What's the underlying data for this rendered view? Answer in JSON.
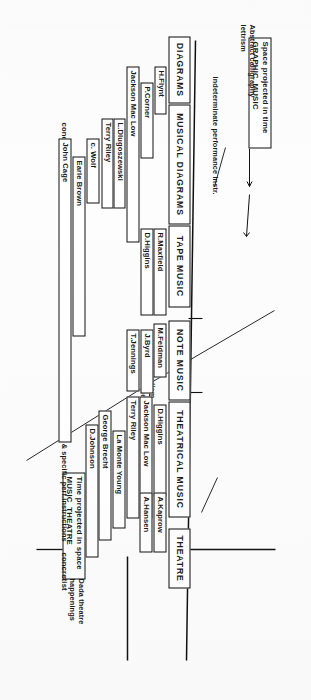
{
  "diagram": {
    "axis_labels": [
      {
        "id": "axis-top-concretist",
        "text": "concretist"
      },
      {
        "id": "axis-mid-abstract",
        "text": "abstract"
      },
      {
        "id": "axis-bottom-concretist",
        "text": "concretist"
      }
    ],
    "categories": [
      {
        "id": "diagrams",
        "label": "DIAGRAMS"
      },
      {
        "id": "musical-diagrams",
        "label": "MUSICAL DIAGRAMS"
      },
      {
        "id": "tape-music",
        "label": "TAPE MUSIC"
      },
      {
        "id": "note-music",
        "label": "NOTE MUSIC"
      },
      {
        "id": "theatrical-music",
        "label": "THEATRICAL MUSIC"
      },
      {
        "id": "theatre",
        "label": "THEATRE"
      }
    ],
    "influence_boxes": [
      {
        "id": "graphic-music",
        "line1": "Space projected in time",
        "line2": "GRAPHIC  MUSIC"
      },
      {
        "id": "music-theatre",
        "line1": "Time projected in space",
        "line2": "MUSIC  THEATRE"
      }
    ],
    "annotations": [
      {
        "id": "abstract-calligraphy",
        "text": "Abstract calligraphy\nlettrism"
      },
      {
        "id": "indeterminate-performance",
        "text": "indeterminate performance instr."
      },
      {
        "id": "futurist-brutism",
        "text": "Futurist Brutism\nvia Varese"
      },
      {
        "id": "determinate-specific",
        "text": "determinate & specific perf.instructions"
      },
      {
        "id": "dada-theatre",
        "text": "Dada theatre\nhappenings"
      }
    ],
    "people": [
      {
        "id": "h-flynt",
        "name": "H.Flynt"
      },
      {
        "id": "p-corner",
        "name": "P.Corner"
      },
      {
        "id": "jackson-mac-low-1",
        "name": "Jackson Mac Low"
      },
      {
        "id": "l-dlugoszewski",
        "name": "L.Dlugoszewski"
      },
      {
        "id": "terry-riley-1",
        "name": "Terry Riley"
      },
      {
        "id": "c-wolf",
        "name": "c. Wolf"
      },
      {
        "id": "earle-brown",
        "name": "Earle Brown"
      },
      {
        "id": "john-cage",
        "name": "John Cage"
      },
      {
        "id": "r-maxfield",
        "name": "R.Maxfield"
      },
      {
        "id": "d-higgins-1",
        "name": "D.Higgins"
      },
      {
        "id": "m-feldman",
        "name": "M.Feldman"
      },
      {
        "id": "j-byrd",
        "name": "J.Byrd"
      },
      {
        "id": "t-jennings",
        "name": "T.Jennings"
      },
      {
        "id": "d-higgins-2",
        "name": "D.Higgins"
      },
      {
        "id": "jackson-mac-low-2",
        "name": "Jackson Mac Low"
      },
      {
        "id": "terry-riley-2",
        "name": "Terry Riley"
      },
      {
        "id": "la-monte-young",
        "name": "La Monte Young"
      },
      {
        "id": "george-brecht",
        "name": "George Brecht"
      },
      {
        "id": "d-johnson",
        "name": "D.Johnson"
      },
      {
        "id": "a-kaprow",
        "name": "A.Kaprow"
      },
      {
        "id": "a-hansen",
        "name": "A.Hansen"
      }
    ]
  }
}
